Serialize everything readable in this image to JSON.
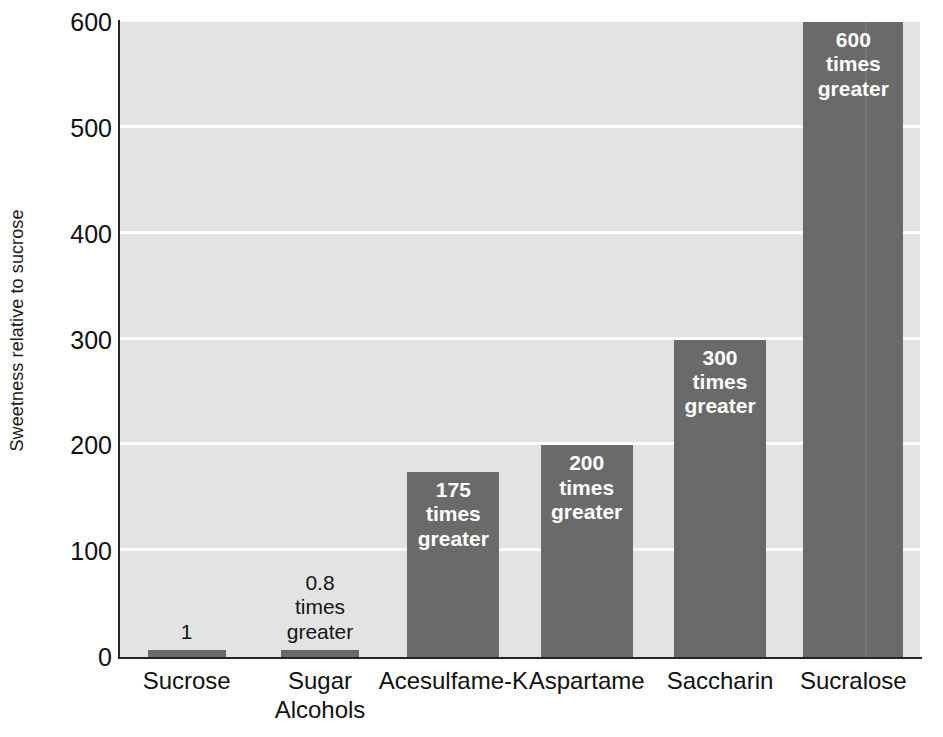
{
  "chart_data": {
    "type": "bar",
    "title": "",
    "subtitle": "",
    "xlabel": "",
    "ylabel": "Sweetness relative to sucrose",
    "ylim": [
      0,
      600
    ],
    "yticks": [
      0,
      100,
      200,
      300,
      400,
      500,
      600
    ],
    "ytick_labels": [
      "0",
      "100",
      "200",
      "300",
      "400",
      "500",
      "600"
    ],
    "grid": "horizontal",
    "legend": "none",
    "categories": [
      "Sucrose",
      "Sugar Alcohols",
      "Acesulfame-K",
      "Aspartame",
      "Saccharin",
      "Sucralose"
    ],
    "values": [
      1,
      0.8,
      175,
      200,
      300,
      600
    ],
    "annotations": [
      "1",
      "0.8 times greater",
      "175 times greater",
      "200 times greater",
      "300 times greater",
      "600 times greater"
    ]
  },
  "colors": {
    "bar": "#6a6a6a",
    "plot_background": "#e3e3e3",
    "gridline": "#fdfdfd",
    "axis": "#242424",
    "page_background": "#ffffff",
    "inner_label_text": "#ffffff",
    "outer_label_text": "#141414"
  },
  "axis": {
    "y_title": "Sweetness relative to sucrose",
    "ticks": [
      {
        "value": "600"
      },
      {
        "value": "500"
      },
      {
        "value": "400"
      },
      {
        "value": "300"
      },
      {
        "value": "200"
      },
      {
        "value": "100"
      },
      {
        "value": "0"
      }
    ]
  },
  "bars": [
    {
      "category": "Sucrose",
      "value": "1",
      "label_lines": [
        "1"
      ],
      "label_inside": false
    },
    {
      "category": "Sugar Alcohols",
      "value": "0.8",
      "label_lines": [
        "0.8",
        "times",
        "greater"
      ],
      "label_inside": false
    },
    {
      "category": "Acesulfame-K",
      "value": "175",
      "label_lines": [
        "175",
        "times",
        "greater"
      ],
      "label_inside": true
    },
    {
      "category": "Aspartame",
      "value": "200",
      "label_lines": [
        "200",
        "times",
        "greater"
      ],
      "label_inside": true
    },
    {
      "category": "Saccharin",
      "value": "300",
      "label_lines": [
        "300",
        "times",
        "greater"
      ],
      "label_inside": true
    },
    {
      "category": "Sucralose",
      "value": "600",
      "label_lines": [
        "600",
        "times",
        "greater"
      ],
      "label_inside": true
    }
  ],
  "category_labels": [
    {
      "lines": [
        "Sucrose"
      ]
    },
    {
      "lines": [
        "Sugar",
        "Alcohols"
      ]
    },
    {
      "lines": [
        "Acesulfame-K"
      ]
    },
    {
      "lines": [
        "Aspartame"
      ]
    },
    {
      "lines": [
        "Saccharin"
      ]
    },
    {
      "lines": [
        "Sucralose"
      ]
    }
  ]
}
